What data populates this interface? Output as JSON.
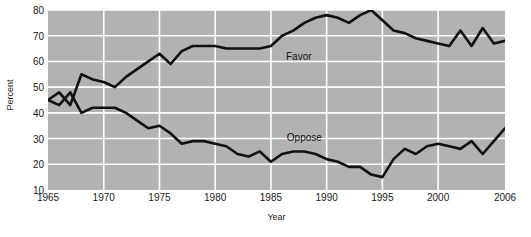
{
  "chart_data": {
    "type": "line",
    "title": "",
    "xlabel": "Year",
    "ylabel": "Percent",
    "xlim": [
      1965,
      2006
    ],
    "ylim": [
      10,
      80
    ],
    "grid": true,
    "legend_position": "inline-annotation",
    "xticks": [
      1965,
      1970,
      1975,
      1980,
      1985,
      1990,
      1995,
      2000,
      2006
    ],
    "yticks": [
      10,
      20,
      30,
      40,
      50,
      60,
      70,
      80
    ],
    "x": [
      1965,
      1966,
      1967,
      1968,
      1969,
      1970,
      1971,
      1972,
      1973,
      1974,
      1975,
      1976,
      1977,
      1978,
      1979,
      1980,
      1981,
      1982,
      1983,
      1984,
      1985,
      1986,
      1987,
      1988,
      1989,
      1990,
      1991,
      1992,
      1993,
      1994,
      1995,
      1996,
      1997,
      1998,
      1999,
      2000,
      2001,
      2002,
      2003,
      2004,
      2005,
      2006
    ],
    "series": [
      {
        "name": "Favor",
        "color": "#111111",
        "values": [
          45,
          48,
          43,
          55,
          53,
          52,
          50,
          54,
          57,
          60,
          63,
          59,
          64,
          66,
          66,
          66,
          65,
          65,
          65,
          65,
          66,
          70,
          72,
          75,
          77,
          78,
          77,
          75,
          78,
          80,
          76,
          72,
          71,
          69,
          68,
          67,
          66,
          72,
          66,
          73,
          67,
          68
        ]
      },
      {
        "name": "Oppose",
        "color": "#111111",
        "values": [
          45,
          43,
          48,
          40,
          42,
          42,
          42,
          40,
          37,
          34,
          35,
          32,
          28,
          29,
          29,
          28,
          27,
          24,
          23,
          25,
          21,
          24,
          25,
          25,
          24,
          22,
          21,
          19,
          19,
          16,
          15,
          22,
          26,
          24,
          27,
          28,
          27,
          26,
          29,
          24,
          29,
          34
        ]
      }
    ],
    "annotations": [
      {
        "text": "Favor",
        "x": 1987.5,
        "y": 62.0
      },
      {
        "text": "Oppose",
        "x": 1988.0,
        "y": 30.5
      }
    ],
    "style": {
      "plot_background": "#b2b2b2",
      "gridline_color": "#ffffff",
      "page_background": "#ffffff",
      "line_color": "#111111",
      "text_color": "#1a1a1a"
    }
  }
}
